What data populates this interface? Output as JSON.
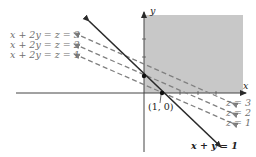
{
  "diagram": {
    "axes": {
      "x_label": "x",
      "y_label": "y"
    },
    "feasible_region": {
      "fill": "#c8c8c8",
      "description": "shaded region x>=0, y>=0 (first quadrant)"
    },
    "constraint_line": {
      "label": "x + y = 1",
      "color": "#2a2a2a"
    },
    "points": [
      {
        "label": "(1, 0)"
      }
    ],
    "level_lines": {
      "left_labels": [
        "x + 2y = z = 3",
        "x + 2y = z = 2",
        "x + 2y = z = 1"
      ],
      "right_labels": [
        "z = 3",
        "z = 2",
        "z = 1"
      ],
      "color": "#7a7a7a"
    }
  }
}
